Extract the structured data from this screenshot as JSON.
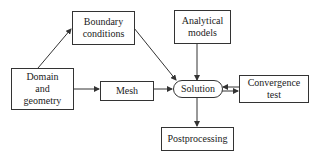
{
  "diagram": {
    "type": "flowchart",
    "nodes": {
      "boundary": {
        "label": "Boundary\nconditions",
        "shape": "rectangle"
      },
      "analytical": {
        "label": "Analytical\nmodels",
        "shape": "rectangle"
      },
      "domain": {
        "label": "Domain\nand\ngeometry",
        "shape": "rectangle"
      },
      "mesh": {
        "label": "Mesh",
        "shape": "rectangle"
      },
      "solution": {
        "label": "Solution",
        "shape": "rounded"
      },
      "convergence": {
        "label": "Convergence\ntest",
        "shape": "rectangle"
      },
      "postprocessing": {
        "label": "Postprocessing",
        "shape": "rectangle"
      }
    },
    "edges": [
      {
        "from": "domain",
        "to": "boundary"
      },
      {
        "from": "domain",
        "to": "mesh"
      },
      {
        "from": "boundary",
        "to": "solution"
      },
      {
        "from": "analytical",
        "to": "solution"
      },
      {
        "from": "mesh",
        "to": "solution"
      },
      {
        "from": "solution",
        "to": "convergence"
      },
      {
        "from": "convergence",
        "to": "solution"
      },
      {
        "from": "solution",
        "to": "postprocessing"
      }
    ],
    "colors": {
      "stroke": "#333333",
      "background": "#ffffff"
    }
  }
}
